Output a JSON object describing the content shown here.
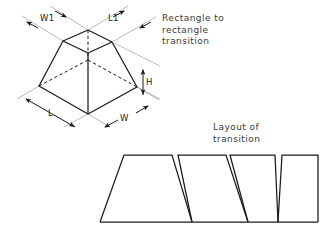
{
  "canvas": {
    "width": 330,
    "height": 237,
    "background": "#ffffff",
    "ink": "#1b1b1b",
    "thin_ink": "#8c8c8c",
    "text_ink": "#3a3a3a"
  },
  "annotations": {
    "rectangle_transition": "Rectangle to\nrectangle\ntransition",
    "layout_transition": "Layout of\ntransition"
  },
  "dimensions": [
    {
      "id": "W1",
      "label": "W1",
      "x": 40,
      "y": 13,
      "describes": "top-face-width"
    },
    {
      "id": "L1",
      "label": "L1",
      "x": 108,
      "y": 13,
      "describes": "top-face-length"
    },
    {
      "id": "H",
      "label": "H",
      "x": 149,
      "y": 80,
      "describes": "vertical-height"
    },
    {
      "id": "L",
      "label": "L",
      "x": 50,
      "y": 110,
      "describes": "base-length"
    },
    {
      "id": "W",
      "label": "W",
      "x": 120,
      "y": 117,
      "describes": "base-width"
    }
  ],
  "frustum": {
    "type": "rectangle-to-rectangle-transition",
    "top_face": [
      [
        88,
        30
      ],
      [
        112,
        42
      ],
      [
        88,
        53
      ],
      [
        63,
        41
      ]
    ],
    "base_face": [
      [
        88,
        60
      ],
      [
        137,
        87
      ],
      [
        88,
        114
      ],
      [
        39,
        86
      ]
    ],
    "visible_base_vertices": [
      [
        39,
        86
      ],
      [
        88,
        114
      ],
      [
        137,
        87
      ]
    ],
    "hidden_base_vertex": [
      88,
      60
    ],
    "visible_edges": [
      [
        [
          63,
          41
        ],
        [
          39,
          86
        ]
      ],
      [
        [
          88,
          53
        ],
        [
          88,
          114
        ]
      ],
      [
        [
          112,
          42
        ],
        [
          137,
          87
        ]
      ],
      [
        [
          63,
          41
        ],
        [
          88,
          30
        ]
      ],
      [
        [
          88,
          30
        ],
        [
          112,
          42
        ]
      ],
      [
        [
          63,
          41
        ],
        [
          88,
          53
        ]
      ],
      [
        [
          88,
          53
        ],
        [
          112,
          42
        ]
      ],
      [
        [
          39,
          86
        ],
        [
          88,
          114
        ]
      ],
      [
        [
          88,
          114
        ],
        [
          137,
          87
        ]
      ]
    ],
    "hidden_edges": [
      [
        [
          88,
          30
        ],
        [
          88,
          60
        ]
      ],
      [
        [
          88,
          60
        ],
        [
          63,
          41
        ]
      ],
      [
        [
          88,
          60
        ],
        [
          112,
          42
        ]
      ]
    ]
  },
  "layout": {
    "baseline_y": 222,
    "top_y": 155,
    "baseline_x_start": 100,
    "baseline_x_end": 318,
    "trapezoids": [
      {
        "index": 1,
        "bottom_left": 100,
        "bottom_right": 192,
        "top_left": 124,
        "top_right": 172
      },
      {
        "index": 2,
        "bottom_left": 192,
        "bottom_right": 248,
        "top_left": 178,
        "top_right": 226
      },
      {
        "index": 3,
        "bottom_left": 248,
        "bottom_right": 278,
        "top_left": 230,
        "top_right": 275
      },
      {
        "index": 4,
        "bottom_left": 278,
        "bottom_right": 318,
        "top_left": 282,
        "top_right": 318
      }
    ]
  }
}
